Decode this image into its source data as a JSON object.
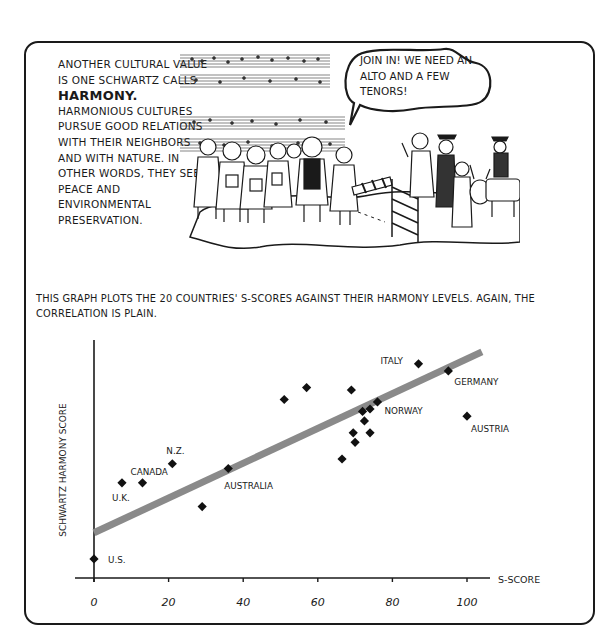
{
  "panel_top": {
    "intro_lines_before": "Another cultural value is one Schwartz calls",
    "keyword": "HARMONY.",
    "intro_lines_after": "Harmonious cultures pursue good relations with their neighbors and with nature. In other words, they seek peace and environmental preservation.",
    "speech_bubble": "JOIN IN! WE NEED AN ALTO AND A FEW TENORS!",
    "illustration": "Choir of singers in folk costume with sheet music, inviting villagers and a goat across a fence"
  },
  "caption": "This graph plots the 20 countries' S-scores against their harmony levels. Again, the correlation is plain.",
  "chart_data": {
    "type": "scatter",
    "title": "",
    "xlabel": "S-SCORE",
    "ylabel": "SCHWARTZ HARMONY SCORE",
    "xlim": [
      0,
      105
    ],
    "ylim": [
      0,
      100
    ],
    "x_ticks": [
      0,
      20,
      40,
      60,
      80,
      100
    ],
    "y_ticks": [],
    "grid": false,
    "legend": null,
    "trendline": {
      "x": [
        0,
        104
      ],
      "y": [
        19,
        95
      ],
      "color": "#8a8a8a"
    },
    "points": [
      {
        "label": "U.S.",
        "x": 0,
        "y": 8
      },
      {
        "label": "U.K.",
        "x": 7.5,
        "y": 40
      },
      {
        "label": "CANADA",
        "x": 13,
        "y": 40
      },
      {
        "label": "N.Z.",
        "x": 21,
        "y": 48
      },
      {
        "label": "",
        "x": 29,
        "y": 30
      },
      {
        "label": "AUSTRALIA",
        "x": 36,
        "y": 46
      },
      {
        "label": "",
        "x": 51,
        "y": 75
      },
      {
        "label": "",
        "x": 57,
        "y": 80
      },
      {
        "label": "",
        "x": 66.5,
        "y": 50
      },
      {
        "label": "",
        "x": 69,
        "y": 79
      },
      {
        "label": "",
        "x": 69.5,
        "y": 61
      },
      {
        "label": "",
        "x": 70,
        "y": 57
      },
      {
        "label": "",
        "x": 72,
        "y": 70
      },
      {
        "label": "",
        "x": 72.5,
        "y": 66
      },
      {
        "label": "",
        "x": 74,
        "y": 61
      },
      {
        "label": "",
        "x": 74,
        "y": 71
      },
      {
        "label": "NORWAY",
        "x": 76,
        "y": 74
      },
      {
        "label": "ITALY",
        "x": 87,
        "y": 90
      },
      {
        "label": "GERMANY",
        "x": 95,
        "y": 87
      },
      {
        "label": "AUSTRIA",
        "x": 100,
        "y": 68
      }
    ]
  }
}
